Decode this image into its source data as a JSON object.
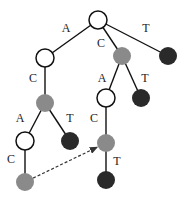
{
  "diagram": {
    "type": "trie",
    "colors": {
      "white": "#ffffff",
      "gray": "#8a8a8a",
      "dark": "#2a2a2a",
      "edge": "#111111"
    },
    "nodes": [
      {
        "id": "root",
        "x": 98,
        "y": 20,
        "fill": "white"
      },
      {
        "id": "A",
        "x": 45,
        "y": 58,
        "fill": "white"
      },
      {
        "id": "C",
        "x": 122,
        "y": 56,
        "fill": "gray"
      },
      {
        "id": "T",
        "x": 168,
        "y": 56,
        "fill": "dark"
      },
      {
        "id": "AC",
        "x": 45,
        "y": 103,
        "fill": "gray"
      },
      {
        "id": "CA",
        "x": 106,
        "y": 98,
        "fill": "white"
      },
      {
        "id": "CT",
        "x": 141,
        "y": 98,
        "fill": "dark"
      },
      {
        "id": "ACA",
        "x": 25,
        "y": 141,
        "fill": "white"
      },
      {
        "id": "ACT",
        "x": 70,
        "y": 141,
        "fill": "dark"
      },
      {
        "id": "CAC",
        "x": 106,
        "y": 143,
        "fill": "gray"
      },
      {
        "id": "ACAC",
        "x": 25,
        "y": 182,
        "fill": "gray"
      },
      {
        "id": "CACT",
        "x": 106,
        "y": 180,
        "fill": "dark"
      }
    ],
    "edges": [
      {
        "from": "root",
        "to": "A",
        "label": "A",
        "lx": 66,
        "ly": 32
      },
      {
        "from": "root",
        "to": "C",
        "label": "C",
        "lx": 101,
        "ly": 47
      },
      {
        "from": "root",
        "to": "T",
        "label": "T",
        "lx": 146,
        "ly": 32
      },
      {
        "from": "A",
        "to": "AC",
        "label": "C",
        "lx": 33,
        "ly": 82
      },
      {
        "from": "C",
        "to": "CA",
        "label": "A",
        "lx": 102,
        "ly": 82
      },
      {
        "from": "C",
        "to": "CT",
        "label": "T",
        "lx": 145,
        "ly": 82
      },
      {
        "from": "AC",
        "to": "ACA",
        "label": "A",
        "lx": 20,
        "ly": 122
      },
      {
        "from": "AC",
        "to": "ACT",
        "label": "T",
        "lx": 70,
        "ly": 122
      },
      {
        "from": "CA",
        "to": "CAC",
        "label": "C",
        "lx": 94,
        "ly": 122
      },
      {
        "from": "ACA",
        "to": "ACAC",
        "label": "C",
        "lx": 11,
        "ly": 163
      },
      {
        "from": "CAC",
        "to": "CACT",
        "label": "T",
        "lx": 117,
        "ly": 165
      }
    ],
    "links": [
      {
        "from": "ACAC",
        "to": "CAC",
        "style": "dashed-arrow"
      }
    ]
  }
}
